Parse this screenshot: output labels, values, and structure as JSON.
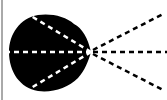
{
  "diagram": {
    "type": "radiation-pattern",
    "colors": {
      "background": "#ffffff",
      "blob": "#000000",
      "inner_dash": "#ffffff",
      "outer_dash": "#000000",
      "border": "#555555"
    },
    "apex": {
      "x": 91,
      "y": 52
    },
    "blob": {
      "left": 8,
      "top": 15,
      "right": 91,
      "bottom": 92
    },
    "rays": [
      {
        "name": "upper",
        "angle_deg": -28
      },
      {
        "name": "center",
        "angle_deg": 0
      },
      {
        "name": "lower",
        "angle_deg": 28
      }
    ]
  }
}
